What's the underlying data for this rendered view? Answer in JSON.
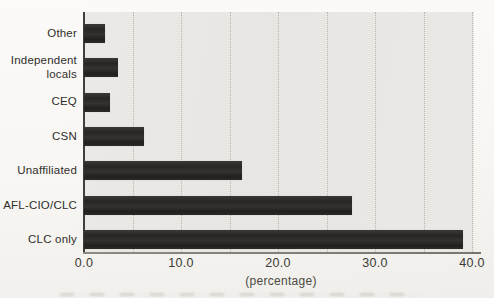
{
  "chart_data": {
    "type": "bar",
    "orientation": "horizontal",
    "categories": [
      "Other",
      "Independent locals",
      "CEQ",
      "CSN",
      "Unaffiliated",
      "AFL-CIO/CLC",
      "CLC only"
    ],
    "values": [
      2.2,
      3.5,
      2.7,
      6.2,
      16.3,
      27.6,
      39.1
    ],
    "title": "",
    "xlabel": "(percentage)",
    "ylabel": "",
    "xlim": [
      0,
      40
    ],
    "tick_labels": [
      "0.0",
      "10.0",
      "20.0",
      "30.0",
      "40.0"
    ],
    "tick_values": [
      0,
      10,
      20,
      30,
      40
    ],
    "grid": "dotted-vertical",
    "grid_step": 5,
    "legend": "none",
    "bar_color": "#2b2a27",
    "plot_bg": "#e8e7e3",
    "page_bg": "#f8f7f4"
  }
}
